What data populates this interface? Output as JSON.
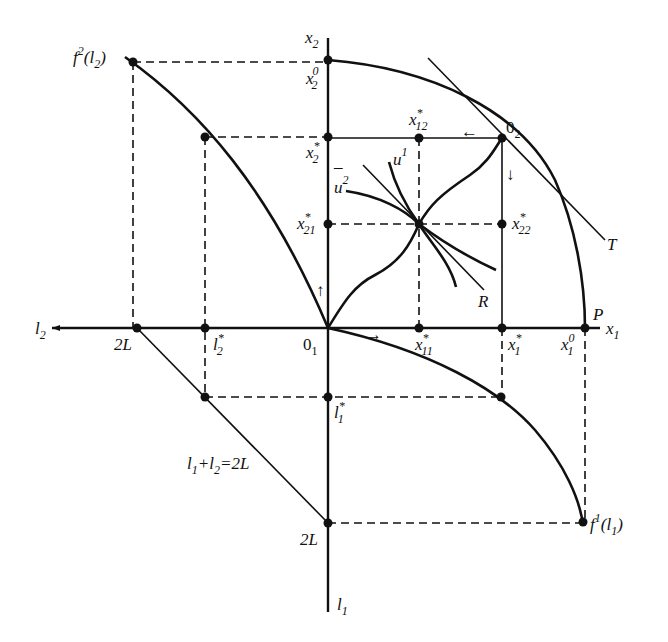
{
  "diagram": {
    "type": "four-quadrant general equilibrium diagram (Edgeworth box with production functions and labor constraint)",
    "colors": {
      "ink": "#111111",
      "background": "#ffffff"
    },
    "axes": {
      "x2": {
        "base": "x",
        "sub": "2"
      },
      "x1": {
        "base": "x",
        "sub": "1"
      },
      "l2": {
        "base": "l",
        "sub": "2"
      },
      "l1": {
        "base": "l",
        "sub": "1"
      }
    },
    "labels": {
      "f2": {
        "base": "f",
        "sup": "2",
        "arg_open": "(l",
        "arg_sub": "2",
        "arg_close": ")"
      },
      "f1": {
        "base": "f",
        "sup": "1",
        "arg_open": "(l",
        "arg_sub": "1",
        "arg_close": ")"
      },
      "x2_0": {
        "base": "x",
        "sup": "0",
        "sub": "2"
      },
      "x2_star": {
        "base": "x",
        "sup": "*",
        "sub": "2"
      },
      "x21_star": {
        "base": "x",
        "sup": "*",
        "sub": "21"
      },
      "x12_star": {
        "base": "x",
        "sup": "*",
        "sub": "12"
      },
      "x22_star": {
        "base": "x",
        "sup": "*",
        "sub": "22"
      },
      "x11_star": {
        "base": "x",
        "sup": "*",
        "sub": "11"
      },
      "x1_star": {
        "base": "x",
        "sup": "*",
        "sub": "1"
      },
      "x1_0": {
        "base": "x",
        "sup": "0",
        "sub": "1"
      },
      "O2": {
        "base": "0",
        "sub": "2"
      },
      "O1": {
        "base": "0",
        "sub": "1"
      },
      "u1": {
        "base": "u",
        "sup": "1"
      },
      "u2bar": {
        "base": "u",
        "bar": "¯",
        "sup": "2"
      },
      "T": "T",
      "R": "R",
      "P": "P",
      "twoL_h": "2L",
      "twoL_v": "2L",
      "l2_star": {
        "base": "l",
        "sup": "*",
        "sub": "2"
      },
      "l1_star": {
        "base": "l",
        "sup": "*",
        "sub": "1"
      },
      "constraint": {
        "a": "l",
        "a_sub": "1",
        "plus": "+",
        "b": "l",
        "b_sub": "2",
        "eq": "=2L"
      }
    },
    "arrows": {
      "up": "↑",
      "left": "←",
      "down": "↓",
      "right": "→"
    }
  }
}
